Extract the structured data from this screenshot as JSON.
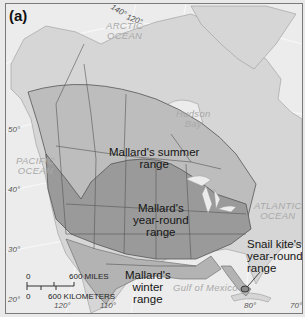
{
  "figure": {
    "panel_label": "(a)",
    "colors": {
      "ocean": "#ececec",
      "land": "#d6d6d6",
      "summer_range": "#bdbdbd",
      "year_round_range": "#9a9a9a",
      "winter_range": "#b3b3b3",
      "border": "#444444",
      "ocean_label": "#a9a9a9"
    }
  },
  "labels": {
    "oceans": {
      "arctic": [
        "ARCTIC",
        "OCEAN"
      ],
      "pacific": [
        "PACIFIC",
        "OCEAN"
      ],
      "atlantic": [
        "ATLANTIC",
        "OCEAN"
      ],
      "hudson": [
        "Hudson",
        "Bay"
      ],
      "gulf": "Gulf of Mexico"
    },
    "ranges": {
      "mallard_summer": [
        "Mallard's summer",
        "range"
      ],
      "mallard_year_round": [
        "Mallard's",
        "year-round",
        "range"
      ],
      "mallard_winter": [
        "Mallard's",
        "winter",
        "range"
      ],
      "snail_kite": [
        "Snail kite's",
        "year-round",
        "range"
      ]
    },
    "latitudes": [
      "50°",
      "40°",
      "30°",
      "20°"
    ],
    "longitudes_top": [
      "140°",
      "120°"
    ],
    "longitudes_bottom": [
      "120°",
      "110°",
      "80°",
      "70°"
    ]
  },
  "scale_bar": {
    "miles_zero": "0",
    "miles_label": "600 MILES",
    "km_zero": "0",
    "km_label": "600 KILOMETERS"
  }
}
